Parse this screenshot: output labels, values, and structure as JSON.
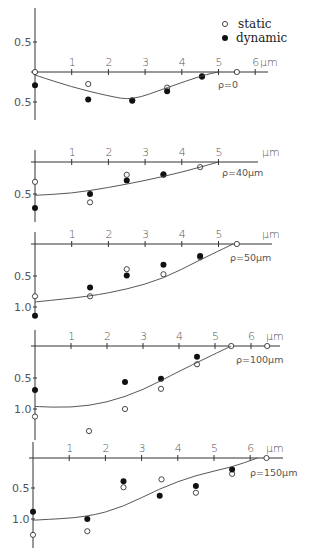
{
  "legend": {
    "static_label": "static",
    "dynamic_label": "dynamic"
  },
  "chart_data": [
    {
      "type": "scatter",
      "title": "ρ=0",
      "xlabel": "μm",
      "ylabel": "",
      "x_ticks": [
        1,
        2,
        3,
        4,
        5,
        6
      ],
      "y_tick_labels": [
        "0.5",
        "0.5"
      ],
      "y_ticks": [
        -0.5,
        0.5
      ],
      "ylim": [
        -0.6,
        0.55
      ],
      "y_inverted": true,
      "series": [
        {
          "name": "static",
          "marker": "open-circle",
          "x": [
            0,
            1.45,
            2.65,
            3.6,
            4.55,
            5.5
          ],
          "y": [
            0,
            0.2,
            0.47,
            0.26,
            0.08,
            0
          ]
        },
        {
          "name": "dynamic",
          "marker": "filled-circle",
          "x": [
            0,
            1.45,
            2.65,
            3.6,
            4.55
          ],
          "y": [
            0.22,
            0.46,
            0.48,
            0.32,
            0.07
          ]
        },
        {
          "name": "fit",
          "marker": "line",
          "x": [
            0,
            1,
            2,
            2.65,
            3.6,
            4.6,
            5.0
          ],
          "y": [
            0.05,
            0.25,
            0.4,
            0.47,
            0.26,
            0.05,
            0
          ]
        }
      ]
    },
    {
      "type": "scatter",
      "title": "ρ=40μm",
      "xlabel": "μm",
      "x_ticks": [
        1,
        2,
        3,
        4,
        5
      ],
      "y_tick_labels": [
        "0.5"
      ],
      "y_ticks": [
        0.5
      ],
      "y_inverted": true,
      "series": [
        {
          "name": "static",
          "marker": "open-circle",
          "x": [
            0,
            1.5,
            2.5,
            3.5,
            4.5
          ],
          "y": [
            0.31,
            0.63,
            0.2,
            0.19,
            0.08
          ]
        },
        {
          "name": "dynamic",
          "marker": "filled-circle",
          "x": [
            0,
            1.5,
            2.5,
            3.5
          ],
          "y": [
            0.72,
            0.5,
            0.29,
            0.2
          ]
        },
        {
          "name": "fit",
          "marker": "line",
          "x": [
            0,
            1,
            2,
            3,
            4,
            5
          ],
          "y": [
            0.52,
            0.49,
            0.4,
            0.29,
            0.16,
            0
          ]
        }
      ]
    },
    {
      "type": "scatter",
      "title": "ρ=50μm",
      "xlabel": "μm",
      "x_ticks": [
        1,
        2,
        3,
        4,
        5
      ],
      "y_tick_labels": [
        "0.5",
        "1.0"
      ],
      "y_ticks": [
        0.5,
        1.0
      ],
      "y_inverted": true,
      "series": [
        {
          "name": "static",
          "marker": "open-circle",
          "x": [
            0,
            1.5,
            2.5,
            3.5,
            4.5,
            5.5
          ],
          "y": [
            0.83,
            0.83,
            0.4,
            0.48,
            0.21,
            0
          ]
        },
        {
          "name": "dynamic",
          "marker": "filled-circle",
          "x": [
            0,
            1.5,
            2.5,
            3.5,
            4.5
          ],
          "y": [
            1.14,
            0.69,
            0.5,
            0.33,
            0.19
          ]
        },
        {
          "name": "fit",
          "marker": "line",
          "x": [
            0,
            1.5,
            2.5,
            3.5,
            4.5,
            5.4
          ],
          "y": [
            0.92,
            0.83,
            0.72,
            0.55,
            0.25,
            0
          ]
        }
      ]
    },
    {
      "type": "scatter",
      "title": "ρ=100μm",
      "xlabel": "μm",
      "x_ticks": [
        1,
        2,
        3,
        4,
        5,
        6
      ],
      "y_tick_labels": [
        "0.5",
        "1.0"
      ],
      "y_ticks": [
        0.5,
        1.0
      ],
      "y_inverted": true,
      "series": [
        {
          "name": "static",
          "marker": "open-circle",
          "x": [
            0,
            1.5,
            2.5,
            3.5,
            4.5,
            5.45,
            6.45
          ],
          "y": [
            1.12,
            1.35,
            1.0,
            0.68,
            0.29,
            0,
            0
          ]
        },
        {
          "name": "dynamic",
          "marker": "filled-circle",
          "x": [
            0,
            2.5,
            3.5,
            4.5
          ],
          "y": [
            0.7,
            0.57,
            0.52,
            0.17
          ]
        },
        {
          "name": "fit",
          "marker": "line",
          "x": [
            0,
            1,
            2,
            3,
            4,
            5.45
          ],
          "y": [
            0.96,
            0.98,
            0.9,
            0.7,
            0.4,
            0
          ]
        }
      ]
    },
    {
      "type": "scatter",
      "title": "ρ=150μm",
      "xlabel": "μm",
      "x_ticks": [
        1,
        2,
        3,
        4,
        5,
        6
      ],
      "y_tick_labels": [
        "0.5",
        "1.0"
      ],
      "y_ticks": [
        0.5,
        1.0
      ],
      "y_inverted": true,
      "series": [
        {
          "name": "static",
          "marker": "open-circle",
          "x": [
            0,
            1.5,
            2.5,
            3.55,
            4.5,
            5.5,
            6.45
          ],
          "y": [
            1.26,
            1.2,
            0.48,
            0.35,
            0.57,
            0.26,
            0
          ]
        },
        {
          "name": "dynamic",
          "marker": "filled-circle",
          "x": [
            0,
            1.5,
            2.5,
            3.5,
            4.5,
            5.5
          ],
          "y": [
            0.88,
            1.0,
            0.38,
            0.62,
            0.46,
            0.19
          ]
        },
        {
          "name": "fit",
          "marker": "line",
          "x": [
            0,
            1.5,
            2.5,
            3.5,
            4.5,
            5.5,
            6.2
          ],
          "y": [
            1.02,
            0.97,
            0.8,
            0.5,
            0.28,
            0.15,
            0
          ]
        }
      ]
    }
  ],
  "panels": [
    {
      "rho_label": "ρ=0",
      "x_tick_labels": [
        "1",
        "2",
        "3",
        "4",
        "5",
        "6"
      ],
      "unit": "μm",
      "y_labels": [
        "0.5",
        "0.5"
      ]
    },
    {
      "rho_label": "ρ=40μm",
      "x_tick_labels": [
        "1",
        "2",
        "3",
        "4",
        "5"
      ],
      "unit": "μm",
      "y_labels": [
        "0.5"
      ]
    },
    {
      "rho_label": "ρ=50μm",
      "x_tick_labels": [
        "1",
        "2",
        "3",
        "4",
        "5"
      ],
      "unit": "μm",
      "y_labels": [
        "0.5",
        "1.0"
      ]
    },
    {
      "rho_label": "ρ=100μm",
      "x_tick_labels": [
        "1",
        "2",
        "3",
        "4",
        "5",
        "6"
      ],
      "unit": "μm",
      "y_labels": [
        "0.5",
        "1.0"
      ]
    },
    {
      "rho_label": "ρ=150μm",
      "x_tick_labels": [
        "1",
        "2",
        "3",
        "4",
        "5",
        "6"
      ],
      "unit": "μm",
      "y_labels": [
        "0.5",
        "1.0"
      ]
    }
  ]
}
